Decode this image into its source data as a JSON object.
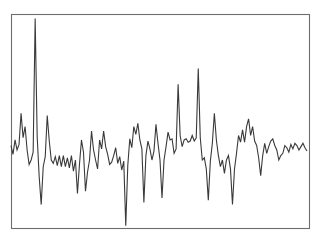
{
  "figure": {
    "width": 321,
    "height": 244,
    "background_color": "#ffffff"
  },
  "frame": {
    "name": "plot-border",
    "x": 11,
    "y": 14,
    "width": 298,
    "height": 214,
    "stroke_color": "#6e6e6e",
    "stroke_width": 1.1,
    "fill": "none"
  },
  "chart_data": {
    "type": "line",
    "title": "",
    "subtitle": "",
    "xlabel": "",
    "ylabel": "",
    "legend": [],
    "legend_position": "none",
    "grid": false,
    "axes_visible": false,
    "tick_labels_x": [],
    "tick_labels_y": [],
    "xlim": [
      0,
      148
    ],
    "ylim": [
      -3.6,
      6.0
    ],
    "baseline": 0,
    "series": [
      {
        "name": "signal",
        "color": "#3a3a3a",
        "line_width": 1.1,
        "x": [
          0,
          1,
          2,
          3,
          4,
          5,
          6,
          7,
          8,
          9,
          10,
          11,
          12,
          13,
          14,
          15,
          16,
          17,
          18,
          19,
          20,
          21,
          22,
          23,
          24,
          25,
          26,
          27,
          28,
          29,
          30,
          31,
          32,
          33,
          34,
          35,
          36,
          37,
          38,
          39,
          40,
          41,
          42,
          43,
          44,
          45,
          46,
          47,
          48,
          49,
          50,
          51,
          52,
          53,
          54,
          55,
          56,
          57,
          58,
          59,
          60,
          61,
          62,
          63,
          64,
          65,
          66,
          67,
          68,
          69,
          70,
          71,
          72,
          73,
          74,
          75,
          76,
          77,
          78,
          79,
          80,
          81,
          82,
          83,
          84,
          85,
          86,
          87,
          88,
          89,
          90,
          91,
          92,
          93,
          94,
          95,
          96,
          97,
          98,
          99,
          100,
          101,
          102,
          103,
          104,
          105,
          106,
          107,
          108,
          109,
          110,
          111,
          112,
          113,
          114,
          115,
          116,
          117,
          118,
          119,
          120,
          121,
          122,
          123,
          124,
          125,
          126,
          127,
          128,
          129,
          130,
          131,
          132,
          133,
          134,
          135,
          136,
          137,
          138,
          139,
          140,
          141,
          142,
          143,
          144,
          145,
          146,
          147
        ],
        "values": [
          0.1,
          -0.3,
          0.35,
          -0.1,
          0.15,
          1.55,
          0.45,
          0.95,
          -0.1,
          -0.75,
          -0.55,
          -0.2,
          5.8,
          0.5,
          -1.3,
          -2.55,
          -0.85,
          -0.4,
          1.45,
          0.3,
          -0.55,
          -0.7,
          -0.4,
          -0.8,
          -0.35,
          -0.85,
          -0.35,
          -0.85,
          -0.45,
          -0.9,
          -0.35,
          -1.05,
          -0.55,
          -2.05,
          -0.75,
          0.35,
          -0.2,
          -1.95,
          -1.1,
          -0.55,
          0.75,
          -0.1,
          -0.55,
          -0.95,
          0.35,
          -0.05,
          0.75,
          0.05,
          -0.3,
          -0.75,
          -0.65,
          -0.35,
          0.0,
          -0.7,
          -0.4,
          -1.0,
          -0.6,
          -3.5,
          -0.8,
          0.4,
          0.0,
          0.95,
          0.6,
          1.1,
          0.35,
          -0.05,
          -2.45,
          -0.35,
          0.3,
          -0.05,
          -0.55,
          -0.15,
          1.05,
          0.2,
          -0.55,
          -2.25,
          -0.55,
          0.05,
          0.7,
          0.35,
          0.4,
          -0.25,
          -0.05,
          2.85,
          0.55,
          0.05,
          0.35,
          0.4,
          0.25,
          0.3,
          0.55,
          0.3,
          0.45,
          3.55,
          0.45,
          -0.55,
          -0.45,
          -0.95,
          -2.35,
          -0.6,
          0.2,
          1.55,
          0.35,
          -0.35,
          -0.85,
          -0.55,
          -1.15,
          -0.55,
          -0.35,
          -0.95,
          -2.55,
          -0.95,
          -0.25,
          0.55,
          0.25,
          0.8,
          0.25,
          0.95,
          1.3,
          0.55,
          0.95,
          0.3,
          0.1,
          -0.45,
          -1.25,
          -0.35,
          0.2,
          -0.25,
          0.05,
          0.3,
          0.4,
          0.1,
          -0.1,
          -0.55,
          -0.35,
          -0.25,
          0.1,
          0.0,
          -0.2,
          0.15,
          -0.05,
          0.2,
          0.1,
          -0.1,
          0.05,
          0.2,
          0.0,
          -0.15
        ]
      }
    ],
    "annotations": [
      {
        "name": "major-positive-spike",
        "x": 12,
        "value": 5.8,
        "description": "tall upward spike near left edge reaching top of frame"
      },
      {
        "name": "major-negative-spike",
        "x": 57,
        "value": -3.5,
        "description": "deep downward spike near center reaching bottom of frame"
      }
    ]
  }
}
